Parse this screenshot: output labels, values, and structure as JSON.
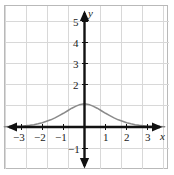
{
  "figure": {
    "width": 174,
    "height": 175,
    "background_color": "#ffffff",
    "border_color": "#b9b9b9"
  },
  "chart_data": {
    "type": "line",
    "title": "",
    "subtitle": "",
    "xlabel": "x",
    "ylabel": "y",
    "xlim": [
      -3.8,
      3.8
    ],
    "ylim": [
      -1.8,
      5.8
    ],
    "grid": true,
    "grid_spacing": 1,
    "legend_position": "none",
    "axis_style": "double-headed-arrows",
    "curve_color": "#8a8a8a",
    "x_tick_labels": [
      "−3",
      "−2",
      "−1",
      "1",
      "2",
      "3"
    ],
    "x_tick_values": [
      -3,
      -2,
      -1,
      1,
      2,
      3
    ],
    "y_tick_labels": [
      "5",
      "4",
      "3",
      "2",
      "−1"
    ],
    "y_tick_values": [
      5,
      4,
      3,
      2,
      -1
    ],
    "peak": {
      "x": 0,
      "y": 1.1
    },
    "series": [
      {
        "name": "bell-curve",
        "x": [
          -3.8,
          -3.5,
          -3.2,
          -3.0,
          -2.8,
          -2.6,
          -2.4,
          -2.2,
          -2.0,
          -1.8,
          -1.6,
          -1.4,
          -1.2,
          -1.0,
          -0.8,
          -0.6,
          -0.4,
          -0.2,
          0.0,
          0.2,
          0.4,
          0.6,
          0.8,
          1.0,
          1.2,
          1.4,
          1.6,
          1.8,
          2.0,
          2.2,
          2.4,
          2.6,
          2.8,
          3.0,
          3.2,
          3.5,
          3.8
        ],
        "y": [
          0.01,
          0.02,
          0.03,
          0.04,
          0.06,
          0.08,
          0.11,
          0.15,
          0.2,
          0.27,
          0.34,
          0.43,
          0.54,
          0.65,
          0.77,
          0.89,
          0.99,
          1.07,
          1.1,
          1.07,
          0.99,
          0.89,
          0.77,
          0.65,
          0.54,
          0.43,
          0.34,
          0.27,
          0.2,
          0.15,
          0.11,
          0.08,
          0.06,
          0.04,
          0.03,
          0.02,
          0.01
        ]
      }
    ]
  }
}
